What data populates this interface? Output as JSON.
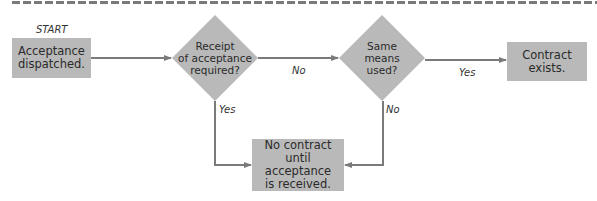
{
  "colors": {
    "shape_fill": "#b9b9b9",
    "connector": "#7a7a7a",
    "text": "#2a2a2a",
    "dashed_rule": "#7a7a7a"
  },
  "diagram": {
    "start_label": "START",
    "nodes": {
      "dispatched": {
        "type": "process",
        "text": "Acceptance\ndispatched."
      },
      "receipt_required": {
        "type": "decision",
        "text": "Receipt\nof acceptance\nrequired?"
      },
      "same_means": {
        "type": "decision",
        "text": "Same\nmeans\nused?"
      },
      "contract_exists": {
        "type": "terminal",
        "text": "Contract\nexists."
      },
      "no_contract": {
        "type": "terminal",
        "text": "No contract\nuntil acceptance\nis received."
      }
    },
    "edges": [
      {
        "from": "dispatched",
        "to": "receipt_required",
        "label": ""
      },
      {
        "from": "receipt_required",
        "to": "same_means",
        "label": "No"
      },
      {
        "from": "same_means",
        "to": "contract_exists",
        "label": "Yes"
      },
      {
        "from": "receipt_required",
        "to": "no_contract",
        "label": "Yes"
      },
      {
        "from": "same_means",
        "to": "no_contract",
        "label": "No"
      }
    ],
    "edge_labels": {
      "receipt_no": "No",
      "same_yes": "Yes",
      "receipt_yes": "Yes",
      "same_no": "No"
    }
  }
}
